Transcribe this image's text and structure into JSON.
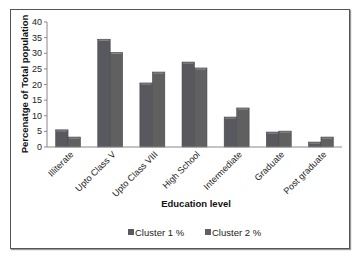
{
  "chart_data": {
    "type": "bar",
    "title": "",
    "xlabel": "Education level",
    "ylabel": "Percenatge of Total population",
    "ylim": [
      0,
      40
    ],
    "yticks": [
      0,
      5,
      10,
      15,
      20,
      25,
      30,
      35,
      40
    ],
    "grid": false,
    "legend_position": "bottom",
    "categories": [
      "Illiterate",
      "Upto Class V",
      "Upto Class VIII",
      "High School",
      "Intermediate",
      "Graduate",
      "Post graduate"
    ],
    "series": [
      {
        "name": "Cluster 1 %",
        "color": "#58585f",
        "values": [
          5.5,
          34.5,
          20.5,
          27.2,
          9.6,
          4.8,
          1.6
        ]
      },
      {
        "name": "Cluster 2 %",
        "color": "#606060",
        "values": [
          3.2,
          30.3,
          24.0,
          25.3,
          12.5,
          5.1,
          3.2
        ]
      }
    ]
  }
}
